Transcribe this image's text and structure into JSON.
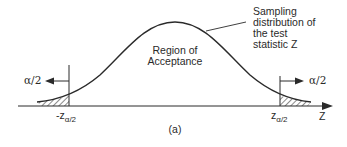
{
  "figure": {
    "caption": "(a)",
    "region_label_line1": "Region of",
    "region_label_line2": "Acceptance",
    "annotation_lines": [
      "Sampling",
      "distribution of",
      "the test",
      "statistic Z"
    ],
    "left_tail_label": "α/2",
    "right_tail_label": "α/2",
    "left_critical": {
      "main": "-z",
      "sub": "α/2"
    },
    "right_critical": {
      "main": "z",
      "sub": "α/2"
    },
    "axis_label": "Z"
  },
  "colors": {
    "ink": "#2a2a2a",
    "background": "#ffffff"
  }
}
